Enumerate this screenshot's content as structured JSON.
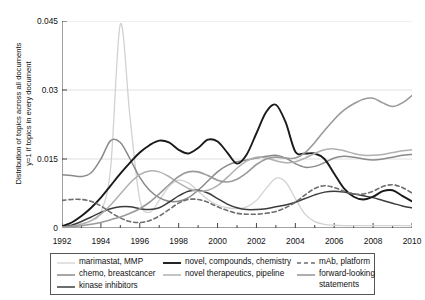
{
  "chart_data": {
    "type": "line",
    "title": "",
    "xlabel": "",
    "ylabel": "Distribution of topics across all documents\ny=1 if topics in every document",
    "xlim": [
      1992,
      2010
    ],
    "ylim": [
      0,
      0.045
    ],
    "yticks": [
      "0",
      "0.015",
      "0.03",
      "0.045"
    ],
    "ytick_values": [
      0,
      0.015,
      0.03,
      0.045
    ],
    "xticks": [
      "1992",
      "1994",
      "1996",
      "1998",
      "2000",
      "2002",
      "2004",
      "2006",
      "2008",
      "2010"
    ],
    "xtick_values": [
      1992,
      1994,
      1996,
      1998,
      2000,
      2002,
      2004,
      2006,
      2008,
      2010
    ],
    "minor_xticks": [
      1993,
      1995,
      1997,
      1999,
      2001,
      2003,
      2005,
      2007,
      2009
    ],
    "grid": "horizontal",
    "legend_position": "below",
    "x": [
      1992,
      1992.5,
      1993,
      1993.5,
      1994,
      1994.5,
      1995,
      1995.5,
      1996,
      1996.5,
      1997,
      1997.5,
      1998,
      1998.5,
      1999,
      1999.5,
      2000,
      2000.5,
      2001,
      2001.5,
      2002,
      2002.5,
      2003,
      2003.5,
      2004,
      2004.5,
      2005,
      2005.5,
      2006,
      2006.5,
      2007,
      2007.5,
      2008,
      2008.5,
      2009,
      2009.5,
      2010
    ],
    "series": [
      {
        "name": "marimastat, MMP",
        "color": "#d2d2d2",
        "dash": "none",
        "width": 1.3,
        "values": [
          0.0004,
          0.0006,
          0.0009,
          0.0016,
          0.0035,
          0.013,
          0.0443,
          0.024,
          0.0062,
          0.0034,
          0.006,
          0.009,
          0.0104,
          0.0098,
          0.008,
          0.0062,
          0.005,
          0.0044,
          0.0042,
          0.0046,
          0.006,
          0.0086,
          0.0108,
          0.01,
          0.0064,
          0.003,
          0.0014,
          0.0008,
          0.0006,
          0.0005,
          0.0005,
          0.0005,
          0.0005,
          0.0005,
          0.0005,
          0.0005,
          0.0005
        ]
      },
      {
        "name": "chemo, breastcancer",
        "color": "#8a8a8a",
        "dash": "none",
        "width": 1.5,
        "values": [
          0.0116,
          0.0114,
          0.0112,
          0.012,
          0.015,
          0.019,
          0.0186,
          0.015,
          0.011,
          0.0082,
          0.0066,
          0.0058,
          0.0058,
          0.0066,
          0.0082,
          0.0102,
          0.0122,
          0.0136,
          0.0144,
          0.0148,
          0.0152,
          0.0156,
          0.0158,
          0.0152,
          0.014,
          0.0132,
          0.0134,
          0.0142,
          0.0152,
          0.0156,
          0.0154,
          0.015,
          0.0148,
          0.015,
          0.0154,
          0.0158,
          0.016
        ]
      },
      {
        "name": "kinase inhibitors",
        "color": "#3c3c3c",
        "dash": "none",
        "width": 1.5,
        "values": [
          0.0002,
          0.0006,
          0.0014,
          0.0024,
          0.0034,
          0.0042,
          0.0046,
          0.0046,
          0.0042,
          0.004,
          0.0044,
          0.0056,
          0.007,
          0.008,
          0.0082,
          0.0076,
          0.0064,
          0.0052,
          0.0044,
          0.004,
          0.004,
          0.0042,
          0.0046,
          0.005,
          0.0056,
          0.0064,
          0.0072,
          0.0078,
          0.008,
          0.0078,
          0.0074,
          0.007,
          0.0066,
          0.006,
          0.0054,
          0.0048,
          0.0044
        ]
      },
      {
        "name": "novel, compounds, chemistry",
        "color": "#1a1a1a",
        "dash": "none",
        "width": 1.9,
        "values": [
          0.0004,
          0.0012,
          0.0026,
          0.0044,
          0.0066,
          0.0092,
          0.0118,
          0.0142,
          0.0164,
          0.018,
          0.019,
          0.0186,
          0.017,
          0.0162,
          0.0174,
          0.0192,
          0.0188,
          0.0164,
          0.014,
          0.016,
          0.0206,
          0.0252,
          0.0268,
          0.023,
          0.0166,
          0.0162,
          0.0162,
          0.015,
          0.0118,
          0.0086,
          0.0068,
          0.0062,
          0.0068,
          0.008,
          0.0082,
          0.007,
          0.0058
        ]
      },
      {
        "name": "novel therapeutics, pipeline",
        "color": "#b0b0b0",
        "dash": "none",
        "width": 1.5,
        "values": [
          0.0002,
          0.0004,
          0.0008,
          0.0016,
          0.003,
          0.005,
          0.0074,
          0.0098,
          0.0116,
          0.0124,
          0.0122,
          0.0112,
          0.0098,
          0.0086,
          0.008,
          0.0082,
          0.0092,
          0.011,
          0.013,
          0.0146,
          0.0154,
          0.0152,
          0.0146,
          0.0142,
          0.0144,
          0.0152,
          0.0162,
          0.017,
          0.0172,
          0.0168,
          0.0162,
          0.0158,
          0.0158,
          0.016,
          0.0164,
          0.0168,
          0.017
        ]
      },
      {
        "name": "mAb, platform",
        "color": "#6e6e6e",
        "dash": "4,3",
        "width": 1.6,
        "values": [
          0.006,
          0.0062,
          0.0062,
          0.0058,
          0.0048,
          0.0034,
          0.0022,
          0.0014,
          0.0012,
          0.0016,
          0.0026,
          0.004,
          0.0054,
          0.0062,
          0.0062,
          0.0056,
          0.0046,
          0.0038,
          0.0032,
          0.003,
          0.003,
          0.0032,
          0.0036,
          0.0044,
          0.0056,
          0.0072,
          0.0086,
          0.0092,
          0.0088,
          0.008,
          0.0074,
          0.0074,
          0.008,
          0.009,
          0.0094,
          0.0088,
          0.0076
        ]
      },
      {
        "name": "forward-looking statements",
        "color": "#9a9a9a",
        "dash": "none",
        "width": 1.6,
        "values": [
          0.0002,
          0.0003,
          0.0005,
          0.0008,
          0.0012,
          0.0018,
          0.0024,
          0.0032,
          0.0042,
          0.0056,
          0.0074,
          0.0094,
          0.0112,
          0.0122,
          0.0122,
          0.0114,
          0.0104,
          0.01,
          0.0106,
          0.012,
          0.0138,
          0.015,
          0.0154,
          0.0152,
          0.0152,
          0.0164,
          0.0186,
          0.0212,
          0.0236,
          0.0256,
          0.027,
          0.028,
          0.0282,
          0.0272,
          0.0264,
          0.0272,
          0.0288
        ]
      }
    ]
  },
  "legend": {
    "columns": [
      {
        "entries": [
          {
            "label": "marimastat, MMP",
            "series": 0
          },
          {
            "label": "chemo, breastcancer",
            "series": 1
          },
          {
            "label": "kinase inhibitors",
            "series": 2
          }
        ]
      },
      {
        "entries": [
          {
            "label": "novel, compounds, chemistry",
            "series": 3
          },
          {
            "label": "novel therapeutics, pipeline",
            "series": 4
          }
        ]
      },
      {
        "entries": [
          {
            "label": "mAb, platform",
            "series": 5
          },
          {
            "label": "forward-looking statements",
            "series": 6
          }
        ]
      }
    ]
  }
}
